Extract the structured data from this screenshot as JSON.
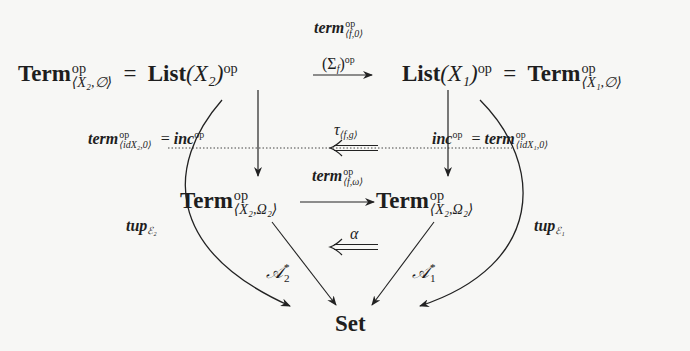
{
  "diagram": {
    "type": "commutative-diagram",
    "nodes": {
      "top_left": {
        "term_bold": "Term",
        "term_sup": "op",
        "term_sub": "⟨X₂,∅⟩",
        "equals": "=",
        "list_bold": "List",
        "list_arg": "(X₂)",
        "list_sup": "op"
      },
      "top_right": {
        "list_bold": "List",
        "list_arg": "(X₁)",
        "list_sup": "op",
        "equals": "=",
        "term_bold": "Term",
        "term_sup": "op",
        "term_sub": "⟨X₁,∅⟩"
      },
      "mid_left": {
        "term_bold": "Term",
        "term_sup": "op",
        "term_sub": "⟨X₂,Ω₂⟩"
      },
      "mid_right": {
        "term_bold": "Term",
        "term_sup": "op",
        "term_sub": "⟨X₂,Ω₂⟩"
      },
      "bottom": {
        "label": "Set"
      }
    },
    "arrows": {
      "top": {
        "label_top_main": "term",
        "label_top_sup": "op",
        "label_top_sub": "⟨f,0⟩",
        "label_bottom_main": "(Σ",
        "label_bottom_sub": "f",
        "label_bottom_close": ")",
        "label_bottom_sup": "op"
      },
      "left_vertical": {
        "label_main": "term",
        "label_sup": "op",
        "label_sub_pre": "⟨id",
        "label_sub_x": "X₂",
        "label_sub_post": ",0⟩",
        "equals": "=",
        "inc_main": "inc",
        "inc_sup": "op"
      },
      "right_vertical": {
        "inc_main": "inc",
        "inc_sup": "op",
        "equals": "=",
        "label_main": "term",
        "label_sup": "op",
        "label_sub_pre": "⟨id",
        "label_sub_x": "X₁",
        "label_sub_post": ",0⟩"
      },
      "tau": {
        "symbol": "τ",
        "sub": "⟨f,g⟩"
      },
      "middle": {
        "label_main": "term",
        "label_sup": "op",
        "label_sub": "⟨f,ω⟩"
      },
      "alpha": {
        "symbol": "α"
      },
      "A2": {
        "main": "𝒜",
        "sup": "*",
        "sub": "2"
      },
      "A1": {
        "main": "𝒜",
        "sup": "*",
        "sub": "1"
      },
      "tup_left": {
        "main": "tup",
        "sub": "ℰ₂"
      },
      "tup_right": {
        "main": "tup",
        "sub": "ℰ₁"
      }
    },
    "colors": {
      "background": "#f7f7f5",
      "ink": "#1e1e1e"
    }
  }
}
